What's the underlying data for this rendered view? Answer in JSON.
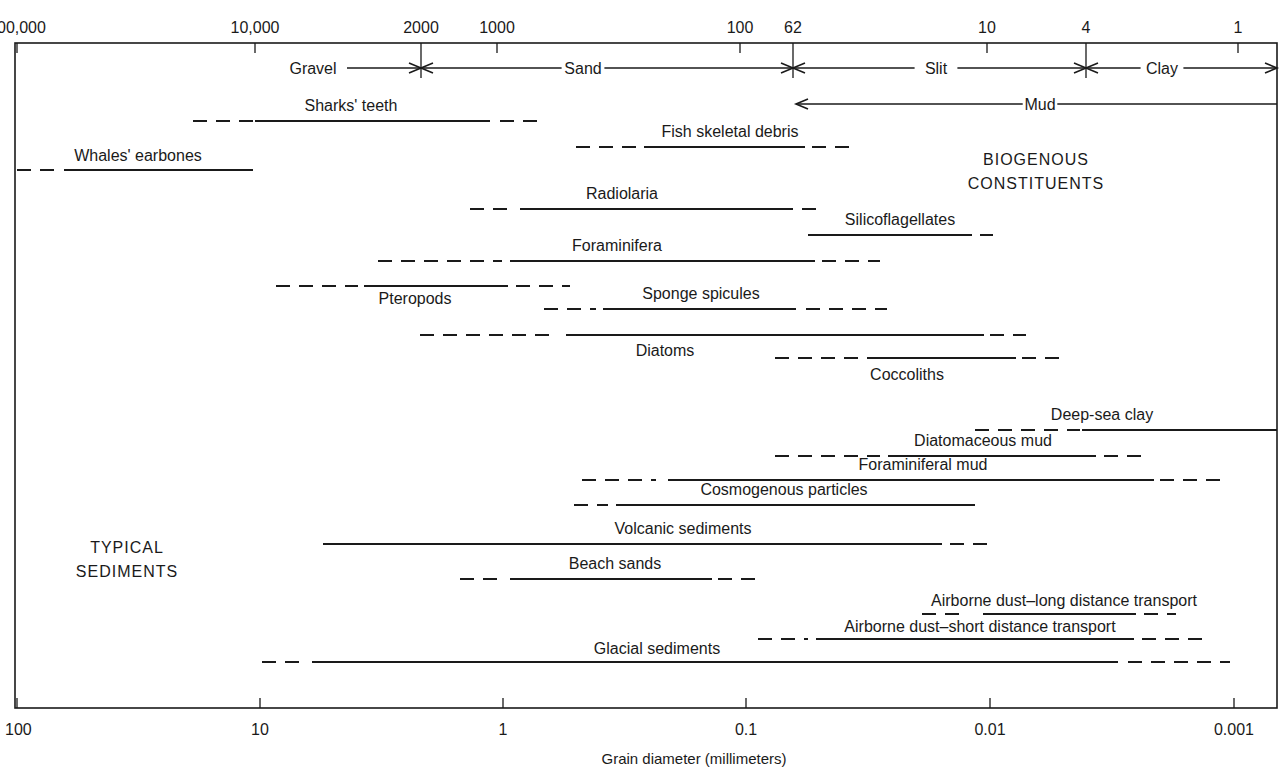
{
  "chart_data": {
    "type": "range-bar",
    "title": "",
    "xlabel": "Grain diameter (millimeters)",
    "x_scale": "log",
    "x_direction": "decreasing left-to-right",
    "xlim_mm": [
      100,
      0.0006
    ],
    "bottom_axis": {
      "ticks": [
        {
          "label": "100",
          "x": 17
        },
        {
          "label": "10",
          "x": 260
        },
        {
          "label": "1",
          "x": 503
        },
        {
          "label": "0.1",
          "x": 746
        },
        {
          "label": "0.01",
          "x": 990
        },
        {
          "label": "0.001",
          "x": 1234
        }
      ]
    },
    "top_axis": {
      "unit": "micrometers",
      "ticks": [
        {
          "label": "100,000",
          "x": 17,
          "long": false
        },
        {
          "label": "10,000",
          "x": 255,
          "long": false
        },
        {
          "label": "2000",
          "x": 421,
          "long": true
        },
        {
          "label": "1000",
          "x": 497,
          "long": false
        },
        {
          "label": "100",
          "x": 740,
          "long": false
        },
        {
          "label": "62",
          "x": 793,
          "long": true
        },
        {
          "label": "10",
          "x": 987,
          "long": false
        },
        {
          "label": "4",
          "x": 1086,
          "long": true
        },
        {
          "label": "1",
          "x": 1238,
          "long": false
        }
      ]
    },
    "size_classes": [
      {
        "name": "Gravel",
        "range_um": [
          ">2000",
          2000
        ],
        "y": 68,
        "x1": 15,
        "x2": 421,
        "label_x": 313,
        "line_start": 347
      },
      {
        "name": "Sand",
        "range_um": [
          2000,
          62
        ],
        "y": 68,
        "x1": 421,
        "x2": 793,
        "label_x": 583
      },
      {
        "name": "Slit",
        "range_um": [
          62,
          4
        ],
        "y": 68,
        "x1": 793,
        "x2": 1086,
        "label_x": 936
      },
      {
        "name": "Clay",
        "range_um": [
          4,
          "<1"
        ],
        "y": 68,
        "x1": 1086,
        "x2": 1277,
        "label_x": 1162
      },
      {
        "name": "Mud",
        "range_um": [
          62,
          "<1"
        ],
        "y": 104,
        "x1": 796,
        "x2": 1277,
        "label_x": 1040
      }
    ],
    "group_labels": [
      {
        "lines": [
          "BIOGENOUS",
          "CONSTITUENTS"
        ],
        "x": 1036,
        "y": 165
      },
      {
        "lines": [
          "TYPICAL",
          "SEDIMENTS"
        ],
        "x": 127,
        "y": 553
      }
    ],
    "series": [
      {
        "group": "biogenous",
        "name": "Sharks' teeth",
        "y": 121,
        "label_x": 351,
        "label_y": 111,
        "dashed_left": [
          193,
          255
        ],
        "solid": [
          255,
          490
        ],
        "dashed_right": [
          500,
          545
        ]
      },
      {
        "group": "biogenous",
        "name": "Fish skeletal debris",
        "y": 147,
        "label_x": 730,
        "label_y": 137,
        "dashed_left": [
          576,
          640
        ],
        "solid": [
          644,
          805
        ],
        "dashed_right": [
          812,
          853
        ]
      },
      {
        "group": "biogenous",
        "name": "Whales' earbones",
        "y": 170,
        "label_x": 138,
        "label_y": 161,
        "dashed_left": [
          17,
          55
        ],
        "solid": [
          64,
          253
        ],
        "dashed_right": null
      },
      {
        "group": "biogenous",
        "name": "Radiolaria",
        "y": 209,
        "label_x": 622,
        "label_y": 199,
        "dashed_left": [
          470,
          512
        ],
        "solid": [
          520,
          793
        ],
        "dashed_right": [
          802,
          822
        ]
      },
      {
        "group": "biogenous",
        "name": "Silicoflagellates",
        "y": 235,
        "label_x": 900,
        "label_y": 225,
        "dashed_left": null,
        "solid": [
          808,
          972
        ],
        "dashed_right": [
          980,
          993
        ]
      },
      {
        "group": "biogenous",
        "name": "Foraminifera",
        "y": 261,
        "label_x": 617,
        "label_y": 251,
        "dashed_left": [
          378,
          502
        ],
        "solid": [
          510,
          815
        ],
        "dashed_right": [
          822,
          880
        ]
      },
      {
        "group": "biogenous",
        "name": "Pteropods",
        "y": 286,
        "label_x": 415,
        "label_y": 304,
        "dashed_left": [
          276,
          358
        ],
        "solid": [
          364,
          508
        ],
        "dashed_right": [
          516,
          570
        ]
      },
      {
        "group": "biogenous",
        "name": "Sponge spicules",
        "y": 309,
        "label_x": 701,
        "label_y": 299,
        "dashed_left": [
          544,
          596
        ],
        "solid": [
          603,
          796
        ],
        "dashed_right": [
          806,
          887
        ]
      },
      {
        "group": "biogenous",
        "name": "Diatoms",
        "y": 335,
        "label_x": 665,
        "label_y": 356,
        "dashed_left": [
          420,
          558
        ],
        "solid": [
          566,
          984
        ],
        "dashed_right": [
          990,
          1026
        ]
      },
      {
        "group": "biogenous",
        "name": "Coccoliths",
        "y": 358,
        "label_x": 907,
        "label_y": 380,
        "dashed_left": [
          775,
          860
        ],
        "solid": [
          867,
          1016
        ],
        "dashed_right": [
          1022,
          1062
        ]
      },
      {
        "group": "sediments",
        "name": "Deep-sea clay",
        "y": 430,
        "label_x": 1102,
        "label_y": 420,
        "dashed_left": [
          975,
          1080
        ],
        "solid": [
          1082,
          1277
        ],
        "dashed_right": null
      },
      {
        "group": "sediments",
        "name": "Diatomaceous mud",
        "y": 456,
        "label_x": 983,
        "label_y": 446,
        "dashed_left": [
          775,
          880
        ],
        "solid": [
          888,
          1096
        ],
        "dashed_right": [
          1104,
          1148
        ]
      },
      {
        "group": "sediments",
        "name": "Foraminiferal mud",
        "y": 480,
        "label_x": 923,
        "label_y": 470,
        "dashed_left": [
          582,
          656
        ],
        "solid": [
          668,
          1154
        ],
        "dashed_right": [
          1160,
          1226
        ]
      },
      {
        "group": "sediments",
        "name": "Cosmogenous particles",
        "y": 505,
        "label_x": 784,
        "label_y": 495,
        "dashed_left": [
          574,
          608
        ],
        "solid": [
          616,
          975
        ],
        "dashed_right": null
      },
      {
        "group": "sediments",
        "name": "Volcanic sediments",
        "y": 544,
        "label_x": 683,
        "label_y": 534,
        "dashed_left": null,
        "solid": [
          323,
          942
        ],
        "dashed_right": [
          950,
          990
        ]
      },
      {
        "group": "sediments",
        "name": "Beach sands",
        "y": 579,
        "label_x": 615,
        "label_y": 569,
        "dashed_left": [
          460,
          498
        ],
        "solid": [
          510,
          712
        ],
        "dashed_right": [
          718,
          760
        ]
      },
      {
        "group": "sediments",
        "name": "Airborne dust–long distance transport",
        "y": 614,
        "label_x": 1064,
        "label_y": 606,
        "dashed_left": [
          922,
          968
        ],
        "solid": [
          983,
          1136
        ],
        "dashed_right": [
          1144,
          1176
        ]
      },
      {
        "group": "sediments",
        "name": "Airborne dust–short distance transport",
        "y": 639,
        "label_x": 980,
        "label_y": 632,
        "dashed_left": [
          758,
          808
        ],
        "solid": [
          816,
          1134
        ],
        "dashed_right": [
          1142,
          1208
        ]
      },
      {
        "group": "sediments",
        "name": "Glacial sediments",
        "y": 662,
        "label_x": 657,
        "label_y": 654,
        "dashed_left": [
          262,
          300
        ],
        "solid": [
          312,
          1118
        ],
        "dashed_right": [
          1128,
          1230
        ]
      }
    ]
  }
}
